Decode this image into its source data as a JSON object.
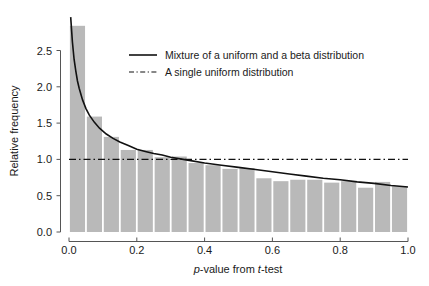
{
  "chart_data": {
    "type": "bar",
    "title": "",
    "subtitle": "",
    "xlabel": "p-value from t-test",
    "xlabel_parts": [
      {
        "text": "p",
        "italic": true
      },
      {
        "text": "-value from ",
        "italic": false
      },
      {
        "text": "t",
        "italic": true
      },
      {
        "text": "-test",
        "italic": false
      }
    ],
    "ylabel": "Relative frequency",
    "xlim": [
      0.0,
      1.0
    ],
    "ylim": [
      0.0,
      2.9
    ],
    "xticks": [
      0.0,
      0.2,
      0.4,
      0.6,
      0.8,
      1.0
    ],
    "xtick_labels": [
      "0.0",
      "0.2",
      "0.4",
      "0.6",
      "0.8",
      "1.0"
    ],
    "yticks": [
      0.0,
      0.5,
      1.0,
      1.5,
      2.0,
      2.5
    ],
    "ytick_labels": [
      "0.0",
      "0.5",
      "1.0",
      "1.5",
      "2.0",
      "2.5"
    ],
    "grid": false,
    "bin_width": 0.05,
    "bar_color": "#b9b9b9",
    "categories": [
      "0.00-0.05",
      "0.05-0.10",
      "0.10-0.15",
      "0.15-0.20",
      "0.20-0.25",
      "0.25-0.30",
      "0.30-0.35",
      "0.35-0.40",
      "0.40-0.45",
      "0.45-0.50",
      "0.50-0.55",
      "0.55-0.60",
      "0.60-0.65",
      "0.65-0.70",
      "0.70-0.75",
      "0.75-0.80",
      "0.80-0.85",
      "0.85-0.90",
      "0.90-0.95",
      "0.95-1.00"
    ],
    "bin_centers": [
      0.025,
      0.075,
      0.125,
      0.175,
      0.225,
      0.275,
      0.325,
      0.375,
      0.425,
      0.475,
      0.525,
      0.575,
      0.625,
      0.675,
      0.725,
      0.775,
      0.825,
      0.875,
      0.925,
      0.975
    ],
    "values": [
      2.84,
      1.59,
      1.31,
      1.13,
      1.13,
      1.03,
      1.04,
      0.95,
      0.92,
      0.87,
      0.88,
      0.74,
      0.7,
      0.72,
      0.72,
      0.68,
      0.7,
      0.61,
      0.69,
      0.63
    ],
    "series": [
      {
        "name": "Mixture of a uniform and a beta distribution",
        "type": "line",
        "style": "solid",
        "color": "#111111",
        "x": [
          0.005,
          0.01,
          0.015,
          0.02,
          0.025,
          0.03,
          0.04,
          0.05,
          0.06,
          0.075,
          0.09,
          0.11,
          0.13,
          0.15,
          0.175,
          0.2,
          0.225,
          0.25,
          0.275,
          0.3,
          0.35,
          0.4,
          0.45,
          0.5,
          0.55,
          0.6,
          0.65,
          0.7,
          0.75,
          0.8,
          0.85,
          0.9,
          0.95,
          1.0
        ],
        "y": [
          2.96,
          2.62,
          2.38,
          2.22,
          2.08,
          1.98,
          1.82,
          1.7,
          1.61,
          1.51,
          1.43,
          1.35,
          1.29,
          1.24,
          1.19,
          1.14,
          1.11,
          1.08,
          1.06,
          1.03,
          0.99,
          0.95,
          0.92,
          0.89,
          0.86,
          0.83,
          0.8,
          0.77,
          0.74,
          0.72,
          0.69,
          0.67,
          0.64,
          0.62
        ]
      },
      {
        "name": "A single uniform distribution",
        "type": "line",
        "style": "dashdot",
        "color": "#111111",
        "x": [
          0.0,
          1.0
        ],
        "y": [
          1.0,
          1.0
        ]
      }
    ],
    "legend": {
      "position": "upper center",
      "entries": [
        {
          "label": "Mixture of a uniform and a beta distribution",
          "style": "solid"
        },
        {
          "label": "A single uniform distribution",
          "style": "dashdot"
        }
      ]
    },
    "annotations": []
  }
}
